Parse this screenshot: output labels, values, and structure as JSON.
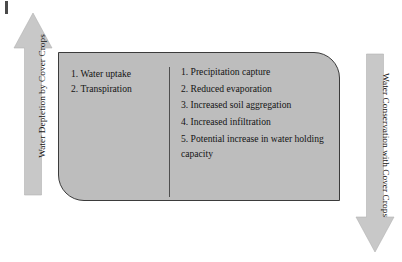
{
  "diagram": {
    "left_arrow": {
      "label": "Water Depletion by Cover Crops",
      "direction": "up",
      "icon": "arrow-up-icon",
      "fill_color": "#c8c8c8"
    },
    "right_arrow": {
      "label": "Water Conservation with Cover Crops",
      "direction": "down",
      "icon": "arrow-down-icon",
      "fill_color": "#c8c8c8"
    },
    "panel": {
      "fill_color": "#bdbdbd",
      "border_color": "#3b3b3b",
      "left_column": [
        "1. Water uptake",
        "2. Transpiration"
      ],
      "right_column": [
        "1. Precipitation capture",
        "2. Reduced evaporation",
        "3. Increased soil aggregation",
        "4. Increased infiltration",
        "5. Potential increase in water holding capacity"
      ]
    }
  }
}
